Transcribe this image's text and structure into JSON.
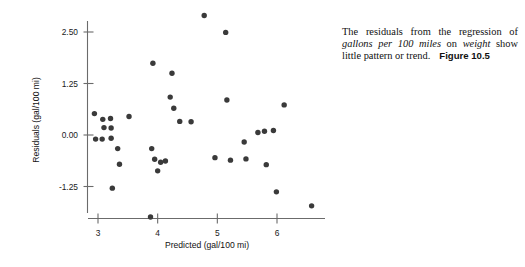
{
  "caption": {
    "part1": "The residuals from the regression of ",
    "emph1": "gallons per 100 miles",
    "part2": " on ",
    "emph2": "weight",
    "part3": " show little pattern or trend.",
    "figure_ref": "Figure 10.5"
  },
  "chart_data": {
    "type": "scatter",
    "title": "",
    "xlabel": "Predicted (gal/100 mi)",
    "ylabel": "Residuals (gal/100 mi)",
    "xlim": [
      2.72,
      6.72
    ],
    "ylim": [
      -2.1,
      3.12
    ],
    "xticks": [
      3,
      4,
      5,
      6
    ],
    "xticklabels": [
      "3",
      "4",
      "5",
      "6"
    ],
    "yticks": [
      2.5,
      1.25,
      0,
      -1.25
    ],
    "yticklabels": [
      "2.50",
      "1.25",
      "0.00",
      "-1.25"
    ],
    "grid": false,
    "legend": null,
    "marker": "filled-circle",
    "marker_color": "#3a3a3a",
    "points": [
      {
        "x": 2.94,
        "y": 0.52
      },
      {
        "x": 2.96,
        "y": -0.1
      },
      {
        "x": 3.07,
        "y": -0.1
      },
      {
        "x": 3.08,
        "y": 0.38
      },
      {
        "x": 3.1,
        "y": 0.18
      },
      {
        "x": 3.21,
        "y": 0.4
      },
      {
        "x": 3.22,
        "y": 0.17
      },
      {
        "x": 3.22,
        "y": -0.08
      },
      {
        "x": 3.24,
        "y": -1.29
      },
      {
        "x": 3.33,
        "y": -0.33
      },
      {
        "x": 3.36,
        "y": -0.71
      },
      {
        "x": 3.52,
        "y": 0.45
      },
      {
        "x": 3.88,
        "y": -1.99
      },
      {
        "x": 3.9,
        "y": -0.33
      },
      {
        "x": 3.92,
        "y": 1.74
      },
      {
        "x": 3.95,
        "y": -0.59
      },
      {
        "x": 4.0,
        "y": -0.87
      },
      {
        "x": 4.05,
        "y": -0.66
      },
      {
        "x": 4.13,
        "y": -0.63
      },
      {
        "x": 4.21,
        "y": 0.92
      },
      {
        "x": 4.24,
        "y": 1.5
      },
      {
        "x": 4.27,
        "y": 0.65
      },
      {
        "x": 4.37,
        "y": 0.33
      },
      {
        "x": 4.56,
        "y": 0.32
      },
      {
        "x": 4.78,
        "y": 2.9
      },
      {
        "x": 4.96,
        "y": -0.55
      },
      {
        "x": 5.14,
        "y": 2.49
      },
      {
        "x": 5.16,
        "y": 0.85
      },
      {
        "x": 5.22,
        "y": -0.61
      },
      {
        "x": 5.45,
        "y": -0.17
      },
      {
        "x": 5.48,
        "y": -0.58
      },
      {
        "x": 5.68,
        "y": 0.06
      },
      {
        "x": 5.79,
        "y": 0.09
      },
      {
        "x": 5.82,
        "y": -0.72
      },
      {
        "x": 5.94,
        "y": 0.11
      },
      {
        "x": 5.99,
        "y": -1.38
      },
      {
        "x": 6.12,
        "y": 0.73
      },
      {
        "x": 6.58,
        "y": -1.72
      }
    ]
  }
}
